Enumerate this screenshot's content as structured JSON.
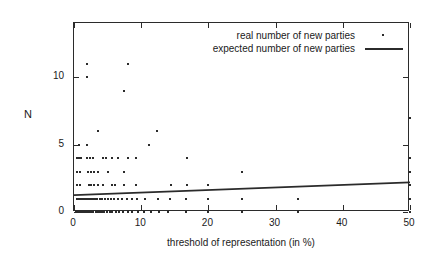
{
  "chart_data": {
    "type": "scatter",
    "title": "",
    "xlabel": "threshold of representation  (in %)",
    "ylabel": "N",
    "xlim": [
      0,
      50
    ],
    "ylim": [
      0,
      14
    ],
    "grid": false,
    "xticks": [
      0,
      10,
      20,
      30,
      40,
      50
    ],
    "xticklabels": [
      "0",
      "10",
      "20",
      "30",
      "40",
      "50"
    ],
    "yticks": [
      0,
      5,
      10
    ],
    "yticklabels": [
      "0",
      "5",
      "10"
    ],
    "legend_position": "top-right",
    "series": [
      {
        "name": "real number of new parties",
        "type": "scatter",
        "marker": "point",
        "color": "#2b2b2b",
        "points": [
          [
            1.9,
            11
          ],
          [
            8.0,
            11
          ],
          [
            1.9,
            10
          ],
          [
            7.5,
            9
          ],
          [
            3.6,
            6
          ],
          [
            12.4,
            6
          ],
          [
            0.7,
            5
          ],
          [
            1.9,
            5
          ],
          [
            11.2,
            5
          ],
          [
            0.5,
            4
          ],
          [
            0.8,
            4
          ],
          [
            1.1,
            4
          ],
          [
            2.0,
            4
          ],
          [
            2.4,
            4
          ],
          [
            2.8,
            4
          ],
          [
            4.3,
            4
          ],
          [
            4.7,
            4
          ],
          [
            5.6,
            4
          ],
          [
            6.6,
            4
          ],
          [
            8.0,
            4
          ],
          [
            9.3,
            4
          ],
          [
            16.8,
            4
          ],
          [
            0.5,
            3
          ],
          [
            0.9,
            3
          ],
          [
            2.1,
            3
          ],
          [
            2.5,
            3
          ],
          [
            3.0,
            3
          ],
          [
            3.6,
            3
          ],
          [
            5.1,
            3
          ],
          [
            7.4,
            3
          ],
          [
            25.0,
            3
          ],
          [
            0.5,
            2
          ],
          [
            0.9,
            2
          ],
          [
            2.2,
            2
          ],
          [
            2.6,
            2
          ],
          [
            3.0,
            2
          ],
          [
            3.5,
            2
          ],
          [
            4.3,
            2
          ],
          [
            5.7,
            2
          ],
          [
            6.1,
            2
          ],
          [
            7.4,
            2
          ],
          [
            9.2,
            2
          ],
          [
            14.4,
            2
          ],
          [
            16.8,
            2
          ],
          [
            20.0,
            2
          ],
          [
            0.4,
            1
          ],
          [
            0.6,
            1
          ],
          [
            0.8,
            1
          ],
          [
            1.0,
            1
          ],
          [
            1.3,
            1
          ],
          [
            1.6,
            1
          ],
          [
            1.9,
            1
          ],
          [
            2.2,
            1
          ],
          [
            2.5,
            1
          ],
          [
            2.8,
            1
          ],
          [
            3.1,
            1
          ],
          [
            3.4,
            1
          ],
          [
            3.8,
            1
          ],
          [
            4.2,
            1
          ],
          [
            4.6,
            1
          ],
          [
            5.0,
            1
          ],
          [
            5.5,
            1
          ],
          [
            6.0,
            1
          ],
          [
            6.6,
            1
          ],
          [
            7.2,
            1
          ],
          [
            7.9,
            1
          ],
          [
            8.6,
            1
          ],
          [
            9.4,
            1
          ],
          [
            10.5,
            1
          ],
          [
            12.5,
            1
          ],
          [
            14.3,
            1
          ],
          [
            16.7,
            1
          ],
          [
            20.0,
            1
          ],
          [
            25.0,
            1
          ],
          [
            33.3,
            1
          ],
          [
            50.0,
            1
          ],
          [
            0.3,
            0
          ],
          [
            0.5,
            0
          ],
          [
            0.7,
            0
          ],
          [
            0.9,
            0
          ],
          [
            1.1,
            0
          ],
          [
            1.3,
            0
          ],
          [
            1.5,
            0
          ],
          [
            1.7,
            0
          ],
          [
            2.0,
            0
          ],
          [
            2.3,
            0
          ],
          [
            2.6,
            0
          ],
          [
            2.9,
            0
          ],
          [
            3.2,
            0
          ],
          [
            3.5,
            0
          ],
          [
            3.8,
            0
          ],
          [
            4.1,
            0
          ],
          [
            4.5,
            0
          ],
          [
            4.9,
            0
          ],
          [
            5.3,
            0
          ],
          [
            5.7,
            0
          ],
          [
            6.2,
            0
          ],
          [
            6.7,
            0
          ],
          [
            7.3,
            0
          ],
          [
            8.0,
            0
          ],
          [
            8.7,
            0
          ],
          [
            9.5,
            0
          ],
          [
            10.4,
            0
          ],
          [
            11.4,
            0
          ],
          [
            12.6,
            0
          ],
          [
            14.0,
            0
          ],
          [
            16.7,
            0
          ],
          [
            20.0,
            0
          ],
          [
            25.0,
            0
          ],
          [
            33.3,
            0
          ],
          [
            50.0,
            0
          ],
          [
            50.0,
            2
          ],
          [
            50.0,
            3
          ],
          [
            50.0,
            4
          ],
          [
            50.0,
            7
          ]
        ]
      },
      {
        "name": "expected number of new parties",
        "type": "line",
        "color": "#2b2b2b",
        "x": [
          0,
          50
        ],
        "y": [
          1.25,
          2.2
        ]
      }
    ]
  },
  "legend": {
    "entries": [
      {
        "label": "real number of new parties",
        "key": "dot"
      },
      {
        "label": "expected number of new parties",
        "key": "line"
      }
    ]
  }
}
